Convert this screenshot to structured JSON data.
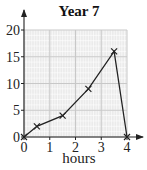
{
  "chart_data": {
    "type": "line",
    "title": "Year 7",
    "xlabel": "hours",
    "ylabel": "",
    "x": [
      0,
      0.5,
      1.5,
      2.5,
      3.5,
      4
    ],
    "series": [
      {
        "name": "Year 7",
        "values": [
          0,
          2,
          4,
          9,
          16,
          0
        ]
      }
    ],
    "x_ticks": [
      "0",
      "1",
      "2",
      "3",
      "4"
    ],
    "y_ticks": [
      "0",
      "5",
      "10",
      "15",
      "20"
    ],
    "xlim": [
      0,
      4
    ],
    "ylim": [
      0,
      20
    ],
    "grid": true,
    "marker": "x",
    "legend": "none"
  },
  "colors": {
    "grid_background": "#ebebeb",
    "grid_minor": "#ffffff",
    "grid_major": "#c8c8c8",
    "line": "#222222"
  }
}
